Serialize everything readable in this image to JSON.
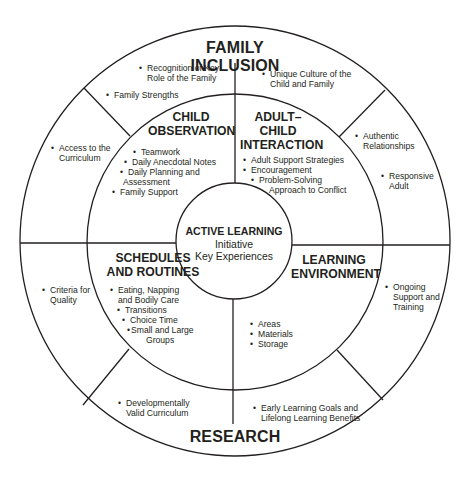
{
  "diagram": {
    "outer_ring": {
      "top_label": "FAMILY INCLUSION",
      "bottom_label": "RESEARCH",
      "segments": {
        "top_left_upper": [
          "Recognition of Key",
          "Role of the Family"
        ],
        "top_left_lower": "Family Strengths",
        "top_right": [
          "Unique Culture of the",
          "Child and Family"
        ],
        "left_upper": [
          "Access to the",
          "Curriculum"
        ],
        "left_lower": [
          "Criteria for",
          "Quality"
        ],
        "right_upper_a": [
          "Authentic",
          "Relationships"
        ],
        "right_upper_b": [
          "Responsive",
          "Adult"
        ],
        "right_lower": [
          "Ongoing",
          "Support and",
          "Training"
        ],
        "bottom_left": [
          "Developmentally",
          "Valid Curriculum"
        ],
        "bottom_right": [
          "Early Learning Goals and",
          "Lifelong Learning Benefits"
        ]
      }
    },
    "quadrants": {
      "child_observation": {
        "title": [
          "CHILD",
          "OBSERVATION"
        ],
        "items": [
          "Teamwork",
          "Daily Anecdotal Notes",
          "Daily Planning and",
          "Assessment",
          "Family Support"
        ]
      },
      "adult_child_interaction": {
        "title": [
          "ADULT–",
          "CHILD",
          "INTERACTION"
        ],
        "items": [
          "Adult Support Strategies",
          "Encouragement",
          "Problem-Solving",
          "Approach to Conflict"
        ]
      },
      "schedules_and_routines": {
        "title": [
          "SCHEDULES",
          "AND ROUTINES"
        ],
        "items": [
          "Eating, Napping",
          "and Bodily Care",
          "Transitions",
          "Choice Time",
          "Small and Large",
          "Groups"
        ]
      },
      "learning_environment": {
        "title": [
          "LEARNING",
          "ENVIRONMENT"
        ],
        "items": [
          "Areas",
          "Materials",
          "Storage"
        ]
      }
    },
    "center": {
      "title": "ACTIVE LEARNING",
      "lines": [
        "Initiative",
        "Key Experiences"
      ]
    },
    "bullet": "•",
    "colors": {
      "line": "#231f20",
      "text": "#231f20",
      "background": "#ffffff"
    }
  }
}
